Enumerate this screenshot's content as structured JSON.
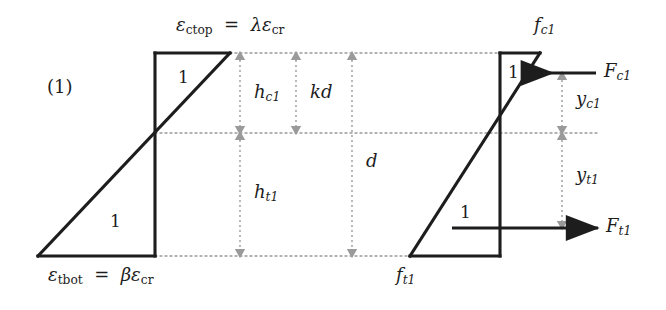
{
  "figure": {
    "case_label": "(1)",
    "colors": {
      "outline": "#1d1d1d",
      "dimension": "#9a9a9a",
      "text": "#1d1d1d",
      "background": "#ffffff"
    }
  },
  "strain_diagram": {
    "name": "strain distribution",
    "top_label": {
      "symbol": "ε",
      "subscript": "ctop",
      "equals": "=",
      "rhs_coefficient": "λ",
      "rhs_symbol": "ε",
      "rhs_subscript": "cr",
      "full_text": "ε_ctop = λε_cr"
    },
    "bottom_label": {
      "symbol": "ε",
      "subscript": "tbot",
      "equals": "=",
      "rhs_coefficient": "β",
      "rhs_symbol": "ε",
      "rhs_subscript": "cr",
      "full_text": "ε_tbot = βε_cr"
    },
    "slope_label_top": "1",
    "slope_label_bottom": "1"
  },
  "stress_diagram": {
    "name": "stress distribution",
    "top_label": {
      "symbol": "f",
      "subscript": "c1",
      "full_text": "f_c1"
    },
    "bottom_label": {
      "symbol": "f",
      "subscript": "t1",
      "full_text": "f_t1"
    },
    "slope_label_top": "1",
    "slope_label_bottom": "1"
  },
  "forces": [
    {
      "id": "compression",
      "symbol": "F",
      "subscript": "c1",
      "full_text": "F_c1",
      "direction": "left"
    },
    {
      "id": "tension",
      "symbol": "F",
      "subscript": "t1",
      "full_text": "F_t1",
      "direction": "right"
    }
  ],
  "dimensions": [
    {
      "id": "h_c1",
      "symbol": "h",
      "subscript": "c1",
      "full_text": "h_c1",
      "span": "top fibre to neutral axis"
    },
    {
      "id": "kd",
      "symbol": "kd",
      "subscript": "",
      "full_text": "kd",
      "span": "top fibre to neutral axis"
    },
    {
      "id": "d",
      "symbol": "d",
      "subscript": "",
      "full_text": "d",
      "span": "top fibre to bottom fibre"
    },
    {
      "id": "h_t1",
      "symbol": "h",
      "subscript": "t1",
      "full_text": "h_t1",
      "span": "neutral axis to bottom fibre"
    },
    {
      "id": "y_c1",
      "symbol": "y",
      "subscript": "c1",
      "full_text": "y_c1",
      "span": "compression force to neutral axis"
    },
    {
      "id": "y_t1",
      "symbol": "y",
      "subscript": "t1",
      "full_text": "y_t1",
      "span": "neutral axis to tension force"
    }
  ]
}
